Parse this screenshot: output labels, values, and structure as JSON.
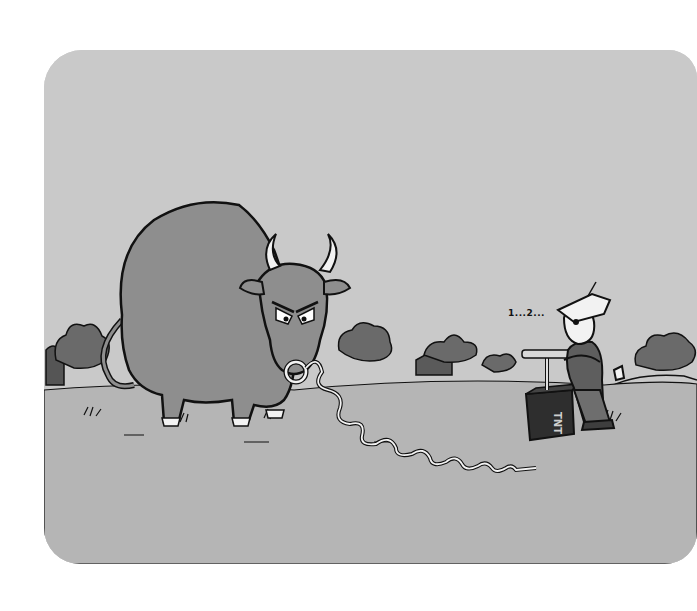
{
  "cartoon": {
    "speech_text": "1...2...",
    "box_label": "TNT",
    "colors": {
      "page_background": "#ffffff",
      "sky": "#c9c9c9",
      "ground": "#b5b5b5",
      "bull_body": "#8e8e8e",
      "trees": "#6a6a6a",
      "ink": "#111111",
      "horn": "#f2f2f2"
    },
    "elements": [
      {
        "name": "bull",
        "description": "large angry bull with horns and nose ring"
      },
      {
        "name": "coiled-wire",
        "description": "spiral wire from nose ring to detonator"
      },
      {
        "name": "tnt-plunger-box",
        "description": "dark detonator box labeled TNT"
      },
      {
        "name": "farmer",
        "description": "man in hat pushing plunger"
      },
      {
        "name": "background-trees-and-barns",
        "description": "distant trees, barns and hills"
      }
    ]
  }
}
